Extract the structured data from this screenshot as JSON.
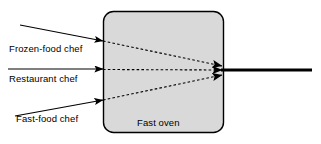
{
  "diagram": {
    "box": {
      "label": "Fast oven",
      "fill_color": "#d9d9d9",
      "stroke_color": "#000000",
      "x": 103,
      "y": 11,
      "width": 121,
      "height": 122,
      "corner_radius": 10
    },
    "inputs": [
      {
        "name": "frozen-food-chef",
        "label": "Frozen-food chef",
        "arrow": {
          "x1": 20,
          "y1": 25,
          "x2": 103,
          "y2": 41
        },
        "dashed": {
          "x1": 103,
          "y1": 41,
          "x2": 222,
          "y2": 66
        }
      },
      {
        "name": "restaurant-chef",
        "label": "Restaurant chef",
        "arrow": {
          "x1": 8,
          "y1": 69,
          "x2": 103,
          "y2": 69
        },
        "dashed": {
          "x1": 103,
          "y1": 69,
          "x2": 222,
          "y2": 70
        }
      },
      {
        "name": "fast-food-chef",
        "label": "Fast-food chef",
        "arrow": {
          "x1": 15,
          "y1": 116,
          "x2": 103,
          "y2": 100
        },
        "dashed": {
          "x1": 103,
          "y1": 100,
          "x2": 222,
          "y2": 75
        }
      }
    ],
    "output": {
      "name": "converged-output-line",
      "x1": 223,
      "y1": 70,
      "x2": 312,
      "y2": 70,
      "thickness": 3,
      "color": "#000000"
    },
    "convergence_point": {
      "x": 222,
      "y": 70
    }
  }
}
